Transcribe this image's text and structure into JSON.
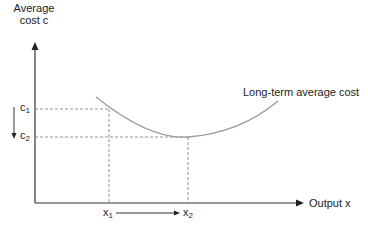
{
  "diagram": {
    "y_axis_label_line1": "Average",
    "y_axis_label_line2": "cost c",
    "x_axis_label": "Output x",
    "curve_label": "Long-term average cost",
    "y_ticks": [
      {
        "base": "c",
        "sub": "1"
      },
      {
        "base": "c",
        "sub": "2"
      }
    ],
    "x_ticks": [
      {
        "base": "x",
        "sub": "1"
      },
      {
        "base": "x",
        "sub": "2"
      }
    ],
    "colors": {
      "axis": "#333333",
      "curve": "#9a9a9a",
      "dashed": "#777777",
      "text": "#222222"
    }
  }
}
